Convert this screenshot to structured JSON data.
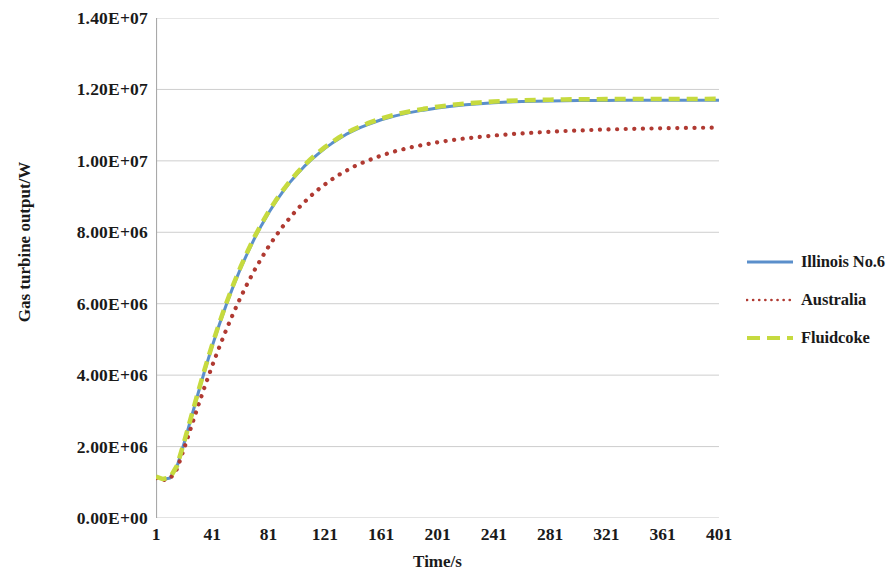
{
  "chart_data": {
    "type": "line",
    "title": "",
    "xlabel": "Time/s",
    "ylabel": "Gas turbine output/W",
    "xlim": [
      1,
      401
    ],
    "ylim": [
      0,
      14000000
    ],
    "ytick_step": 2000000,
    "xtick_step": 40,
    "grid": "horizontal",
    "legend_position": "right",
    "xticks": [
      "1",
      "41",
      "81",
      "121",
      "161",
      "201",
      "241",
      "281",
      "321",
      "361",
      "401"
    ],
    "xtick_values": [
      1,
      41,
      81,
      121,
      161,
      201,
      241,
      281,
      321,
      361,
      401
    ],
    "yticks": [
      "0.00E+00",
      "2.00E+06",
      "4.00E+06",
      "6.00E+06",
      "8.00E+06",
      "1.00E+07",
      "1.20E+07",
      "1.40E+07"
    ],
    "ytick_values": [
      0,
      2000000,
      4000000,
      6000000,
      8000000,
      10000000,
      12000000,
      14000000
    ],
    "x": [
      1,
      6,
      11,
      16,
      21,
      26,
      31,
      36,
      41,
      46,
      51,
      56,
      61,
      66,
      71,
      76,
      81,
      86,
      91,
      96,
      101,
      106,
      111,
      116,
      121,
      126,
      131,
      136,
      141,
      146,
      151,
      161,
      171,
      181,
      191,
      201,
      211,
      221,
      231,
      241,
      251,
      261,
      271,
      281,
      291,
      301,
      311,
      321,
      331,
      341,
      351,
      361,
      371,
      381,
      391,
      401
    ],
    "series": [
      {
        "name": "Illinois No.6",
        "color": "#5B8FCB",
        "style": "solid",
        "values": [
          1150000,
          1080000,
          1120000,
          1450000,
          2100000,
          2800000,
          3500000,
          4180000,
          4820000,
          5420000,
          5980000,
          6500000,
          6980000,
          7420000,
          7830000,
          8200000,
          8540000,
          8850000,
          9130000,
          9390000,
          9620000,
          9830000,
          10020000,
          10190000,
          10350000,
          10490000,
          10620000,
          10740000,
          10840000,
          10930000,
          11010000,
          11150000,
          11260000,
          11350000,
          11420000,
          11480000,
          11530000,
          11570000,
          11600000,
          11625000,
          11645000,
          11660000,
          11670000,
          11678000,
          11684000,
          11688000,
          11691000,
          11693000,
          11695000,
          11696000,
          11697000,
          11698000,
          11698000,
          11699000,
          11699000,
          11700000
        ]
      },
      {
        "name": "Australia",
        "color": "#B03A32",
        "style": "dotted",
        "values": [
          1120000,
          1060000,
          1100000,
          1380000,
          1950000,
          2550000,
          3150000,
          3720000,
          4270000,
          4790000,
          5280000,
          5740000,
          6170000,
          6570000,
          6940000,
          7280000,
          7600000,
          7890000,
          8160000,
          8400000,
          8630000,
          8830000,
          9020000,
          9190000,
          9340000,
          9480000,
          9610000,
          9720000,
          9830000,
          9920000,
          10000000,
          10150000,
          10270000,
          10370000,
          10450000,
          10520000,
          10580000,
          10630000,
          10670000,
          10710000,
          10740000,
          10770000,
          10795000,
          10815000,
          10835000,
          10850000,
          10865000,
          10878000,
          10888000,
          10897000,
          10905000,
          10912000,
          10918000,
          10923000,
          10927000,
          10931000
        ]
      },
      {
        "name": "Fluidcoke",
        "color": "#C6DA3F",
        "style": "dashed",
        "values": [
          1160000,
          1090000,
          1130000,
          1470000,
          2130000,
          2840000,
          3540000,
          4220000,
          4860000,
          5460000,
          6020000,
          6540000,
          7020000,
          7460000,
          7870000,
          8240000,
          8580000,
          8885000,
          9165000,
          9425000,
          9655000,
          9865000,
          10055000,
          10225000,
          10385000,
          10525000,
          10655000,
          10775000,
          10875000,
          10965000,
          11045000,
          11185000,
          11295000,
          11385000,
          11455000,
          11515000,
          11565000,
          11605000,
          11635000,
          11660000,
          11680000,
          11695000,
          11705000,
          11713000,
          11719000,
          11723000,
          11726000,
          11728000,
          11730000,
          11731000,
          11732000,
          11733000,
          11733000,
          11734000,
          11734000,
          11735000
        ]
      }
    ]
  },
  "axes": {
    "y_title": "Gas turbine output/W",
    "x_title": "Time/s"
  },
  "legend": {
    "items": [
      {
        "label": "Illinois No.6",
        "swatch": "solid-line-swatch"
      },
      {
        "label": "Australia",
        "swatch": "dotted-line-swatch"
      },
      {
        "label": "Fluidcoke",
        "swatch": "dashed-line-swatch"
      }
    ]
  },
  "colors": {
    "illinois": "#5B8FCB",
    "australia": "#B03A32",
    "fluidcoke": "#C6DA3F",
    "grid": "#C8C8C8",
    "axis": "#A9A9A9",
    "text": "#1a1a1a"
  }
}
